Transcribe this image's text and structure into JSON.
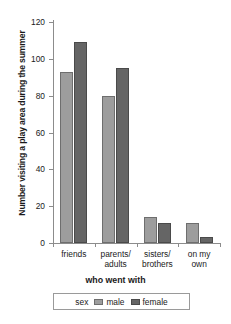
{
  "chart_data": {
    "type": "bar",
    "title": "",
    "categories": [
      "friends",
      "parents/\nadults",
      "sisters/\nbrothers",
      "on my\nown"
    ],
    "series": [
      {
        "name": "male",
        "values": [
          93,
          80,
          14,
          11
        ],
        "color": "#9d9d9d"
      },
      {
        "name": "female",
        "values": [
          109,
          95,
          11,
          3
        ],
        "color": "#656565"
      }
    ],
    "xlabel": "who went with",
    "ylabel": "Number visiting a play area during the summer",
    "ylim": [
      0,
      120
    ],
    "yticks": [
      0,
      20,
      40,
      60,
      80,
      100,
      120
    ],
    "ytick_labels": [
      "0",
      "20",
      "40",
      "60",
      "80",
      "100",
      "120"
    ],
    "grid": false,
    "legend": {
      "title": "sex",
      "position": "bottom",
      "entries": [
        "male",
        "female"
      ]
    }
  }
}
